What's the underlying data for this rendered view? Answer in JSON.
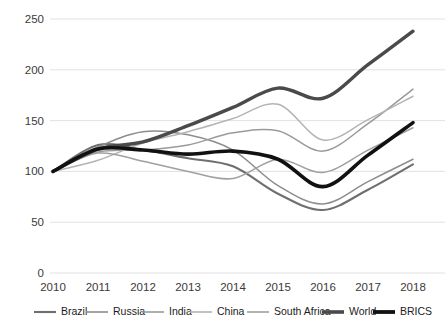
{
  "chart_data": {
    "type": "line",
    "title": "",
    "subtitle": "",
    "xlabel": "",
    "ylabel": "",
    "x": [
      2010,
      2011,
      2012,
      2013,
      2014,
      2015,
      2016,
      2017,
      2018
    ],
    "xticklabels": [
      "2010",
      "2011",
      "2012",
      "2013",
      "2014",
      "2015",
      "2016",
      "2017",
      "2018"
    ],
    "yticklabels": [
      "0",
      "50",
      "100",
      "150",
      "200",
      "250"
    ],
    "yticks": [
      0,
      50,
      100,
      150,
      200,
      250
    ],
    "ylim": [
      0,
      250
    ],
    "xlim": [
      2010,
      2018
    ],
    "grid": "horizontal",
    "legend_position": "bottom",
    "series": [
      {
        "name": "Brazil",
        "color": "#6f6f6f",
        "width": 2.1,
        "values": [
          100,
          126,
          121,
          113,
          105,
          78,
          62,
          82,
          107
        ]
      },
      {
        "name": "Russia",
        "color": "#8d8d8d",
        "width": 1.5,
        "values": [
          100,
          124,
          139,
          136,
          121,
          86,
          68,
          90,
          112
        ]
      },
      {
        "name": "India",
        "color": "#9a9a9a",
        "width": 1.5,
        "values": [
          100,
          119,
          121,
          126,
          138,
          140,
          120,
          147,
          181
        ]
      },
      {
        "name": "China",
        "color": "#b4b4b4",
        "width": 1.5,
        "values": [
          100,
          111,
          128,
          139,
          152,
          166,
          131,
          151,
          174
        ]
      },
      {
        "name": "South Africa",
        "color": "#a0a0a0",
        "width": 1.5,
        "values": [
          100,
          118,
          110,
          100,
          93,
          112,
          99,
          121,
          143
        ]
      },
      {
        "name": "World",
        "color": "#4a4a4a",
        "width": 3.4,
        "values": [
          100,
          122,
          129,
          145,
          163,
          182,
          172,
          205,
          238
        ]
      },
      {
        "name": "BRICS",
        "color": "#111111",
        "width": 3.6,
        "values": [
          100,
          122,
          121,
          117,
          120,
          112,
          85,
          116,
          148
        ]
      }
    ]
  },
  "legend": {
    "items": [
      {
        "label": "Brazil",
        "color": "#6f6f6f",
        "width": 2.1
      },
      {
        "label": "Russia",
        "color": "#8d8d8d",
        "width": 1.6
      },
      {
        "label": "India",
        "color": "#9a9a9a",
        "width": 1.6
      },
      {
        "label": "China",
        "color": "#b4b4b4",
        "width": 1.6
      },
      {
        "label": "South Africa",
        "color": "#a0a0a0",
        "width": 1.6
      },
      {
        "label": "World",
        "color": "#4a4a4a",
        "width": 3.6
      },
      {
        "label": "BRICS",
        "color": "#111111",
        "width": 3.8
      }
    ]
  },
  "axes": {
    "plot_left": 53,
    "plot_right": 413,
    "plot_top": 19,
    "plot_bottom": 273
  }
}
